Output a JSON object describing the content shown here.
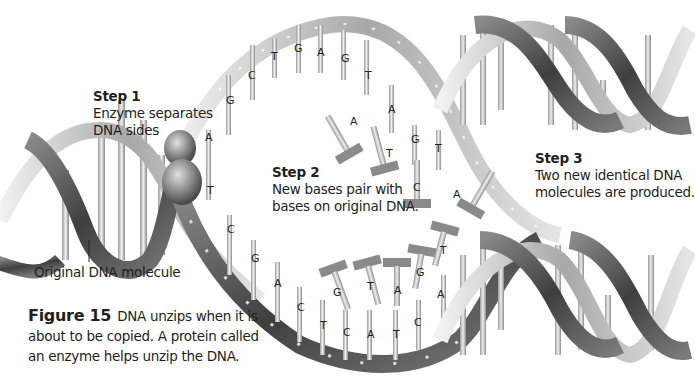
{
  "figure": {
    "number_label": "Figure 15",
    "caption_lines": [
      "DNA unzips when it is",
      "about to be copied. A protein called",
      "an enzyme helps unzip the DNA."
    ]
  },
  "steps": [
    {
      "title": "Step 1",
      "lines": [
        "Enzyme separates",
        "DNA sides"
      ]
    },
    {
      "title": "Step 2",
      "lines": [
        "New bases pair with",
        "bases on original DNA."
      ]
    },
    {
      "title": "Step 3",
      "lines": [
        "Two new identical DNA",
        "molecules are produced."
      ]
    }
  ],
  "callouts": {
    "original_dna": "Original DNA molecule"
  },
  "bases": {
    "upper_strand": [
      "A",
      "G",
      "C",
      "T",
      "G",
      "A",
      "G",
      "T"
    ],
    "enzyme_junction": "T",
    "upper_free_pairing": [
      "A",
      "G",
      "T"
    ],
    "free_nucleotides_upper": [
      "A",
      "T",
      "C",
      "A"
    ],
    "lower_strand": [
      "C",
      "G",
      "A",
      "C",
      "T",
      "C",
      "A",
      "T",
      "C",
      "A"
    ],
    "free_nucleotides_lower": [
      "G",
      "T",
      "A",
      "G",
      "T"
    ]
  },
  "colors": {
    "background": "#ffffff",
    "text": "#231f20",
    "ribbon_dark": "#4a4a4a",
    "ribbon_light": "#d9d9d9",
    "rung": "#cfcfcf"
  }
}
